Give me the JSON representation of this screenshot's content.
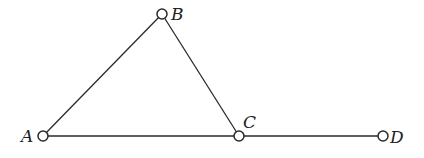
{
  "diagram": {
    "type": "geometry",
    "points": [
      {
        "id": "A",
        "label": "A",
        "x": 43,
        "y": 136,
        "label_x": 22,
        "label_y": 142
      },
      {
        "id": "B",
        "label": "B",
        "x": 162,
        "y": 14,
        "label_x": 171,
        "label_y": 20
      },
      {
        "id": "C",
        "label": "C",
        "x": 239,
        "y": 136,
        "label_x": 243,
        "label_y": 128
      },
      {
        "id": "D",
        "label": "D",
        "x": 383,
        "y": 136,
        "label_x": 390,
        "label_y": 143
      }
    ],
    "segments": [
      {
        "from": "A",
        "to": "B"
      },
      {
        "from": "B",
        "to": "C"
      },
      {
        "from": "A",
        "to": "C"
      },
      {
        "from": "C",
        "to": "D"
      }
    ],
    "colors": {
      "stroke": "#2a2a2a",
      "background": "#ffffff"
    }
  }
}
